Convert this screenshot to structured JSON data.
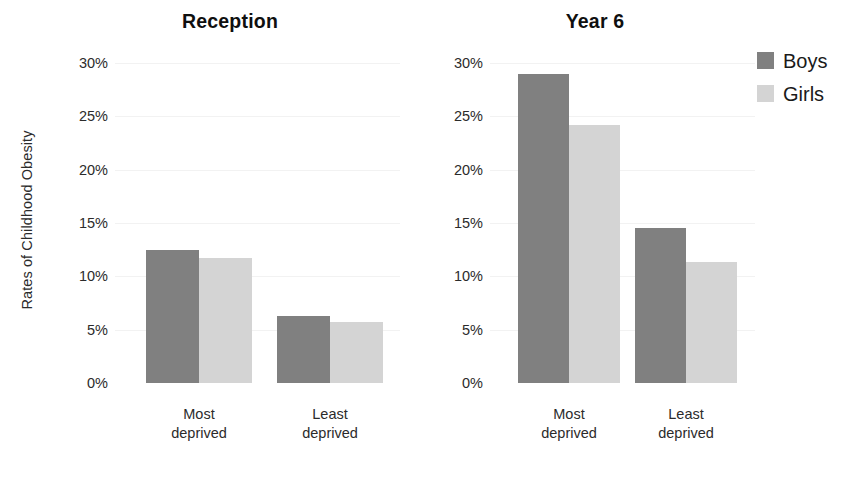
{
  "chart_data": {
    "type": "bar",
    "title": "",
    "xlabel": "",
    "ylabel": "Rates of Childhood Obesity",
    "ylim": [
      0,
      30
    ],
    "ytick_labels": [
      "30%",
      "25%",
      "20%",
      "15%",
      "10%",
      "5%",
      "0%"
    ],
    "ytick_values": [
      30,
      25,
      20,
      15,
      10,
      5,
      0
    ],
    "grid": false,
    "legend_position": "right",
    "legend": [
      "Boys",
      "Girls"
    ],
    "categories": [
      "Most\ndeprived",
      "Least\ndeprived"
    ],
    "panels": [
      {
        "title": "Reception",
        "categories": [
          "Most\ndeprived",
          "Least\ndeprived"
        ],
        "series": [
          {
            "name": "Boys",
            "color": "#808080",
            "values": [
              12.5,
              6.3
            ]
          },
          {
            "name": "Girls",
            "color": "#d4d4d4",
            "values": [
              11.7,
              5.7
            ]
          }
        ]
      },
      {
        "title": "Year 6",
        "categories": [
          "Most\ndeprived",
          "Least\ndeprived"
        ],
        "series": [
          {
            "name": "Boys",
            "color": "#808080",
            "values": [
              29.0,
              14.5
            ]
          },
          {
            "name": "Girls",
            "color": "#d4d4d4",
            "values": [
              24.2,
              11.3
            ]
          }
        ]
      }
    ]
  },
  "axis": {
    "y_title": "Rates of Childhood Obesity"
  },
  "legend": {
    "items": [
      {
        "label": "Boys",
        "color": "#808080"
      },
      {
        "label": "Girls",
        "color": "#d4d4d4"
      }
    ]
  },
  "panel_one": {
    "title": "Reception",
    "ticks": [
      "30%",
      "25%",
      "20%",
      "15%",
      "10%",
      "5%",
      "0%"
    ],
    "cat_one": "Most\ndeprived",
    "cat_two": "Least\ndeprived"
  },
  "panel_two": {
    "title": "Year 6",
    "ticks": [
      "30%",
      "25%",
      "20%",
      "15%",
      "10%",
      "5%",
      "0%"
    ],
    "cat_one": "Most\ndeprived",
    "cat_two": "Least\ndeprived"
  },
  "colors": {
    "boys": "#808080",
    "girls": "#d4d4d4",
    "background": "#ffffff",
    "text": "#2b2b2b"
  }
}
